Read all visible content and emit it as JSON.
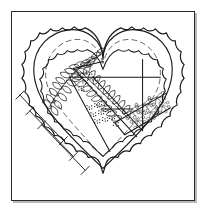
{
  "image": {
    "title": "Heart-Shaped Garden Plan",
    "kind": "line-art-illustration",
    "medium": "black ink line drawing on white",
    "width_px": 209,
    "height_px": 218
  },
  "frame": {
    "border_color": "#2b2b2b",
    "border_width_px": 1.5,
    "background_color": "#ffffff",
    "shadow_color": "#b9b9b9",
    "shadow_offset_px": 2
  },
  "palette": {
    "ink": "#1a1a1a",
    "ink_light": "#4a4a4a",
    "paper": "#ffffff"
  },
  "plan": {
    "shape": "heart",
    "outer_hedge_label": "scalloped outer hedge border",
    "inner_hedge_label": "scalloped inner hedge border",
    "path_label": "dashed gravel path",
    "beds_label": "geometric garden beds",
    "vine_label": "leafy vine border",
    "flowers_label": "flower stipple planting",
    "dimension_label": "dimension annotation lines"
  },
  "heart_geometry": {
    "center_x": 92,
    "notch_y": 56,
    "tip_y": 168,
    "left_lobe_cx": 52,
    "right_lobe_cx": 132,
    "lobe_cy": 42,
    "outer_scale": 1.0,
    "inner_scale": 0.78,
    "path_scale": 0.9
  },
  "beds": [
    {
      "id": "bed-upper-left-triangle",
      "note": "large triangular bed, left"
    },
    {
      "id": "bed-upper-right-rect",
      "note": "rectangular bed, upper right"
    },
    {
      "id": "bed-center-strip",
      "note": "narrow planted strip with vine"
    },
    {
      "id": "bed-lower-right-rect",
      "note": "rectangular bed, lower right"
    },
    {
      "id": "bed-flower-patch",
      "note": "stippled flower patch"
    }
  ],
  "dimension_lines": [
    {
      "id": "dim-outer-lower-left",
      "ticks": 2
    },
    {
      "id": "dim-mid-lower-left",
      "ticks": 2
    },
    {
      "id": "dim-inner-lower-left",
      "ticks": 2
    }
  ]
}
